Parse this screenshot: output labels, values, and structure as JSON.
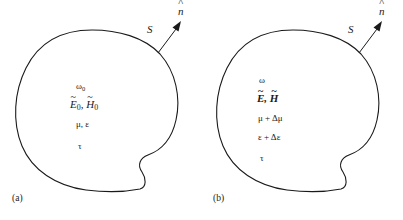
{
  "figure": {
    "type": "diagram",
    "background_color": "#ffffff",
    "line_color": "#1a1a1a"
  },
  "panels": [
    {
      "id": "a",
      "caption": "(a)",
      "surface_label": "S",
      "normal_label": "n",
      "normal_accent": "^",
      "interior": {
        "frequency": {
          "symbol": "ω",
          "subscript": "0"
        },
        "fields": {
          "electric": {
            "symbol": "E",
            "accent": "~",
            "subscript": "0"
          },
          "magnetic": {
            "symbol": "H",
            "accent": "~",
            "subscript": "0"
          },
          "separator": ",",
          "bold": false
        },
        "constitutive": [
          "μ, ε"
        ],
        "conductivity": "τ"
      }
    },
    {
      "id": "b",
      "caption": "(b)",
      "surface_label": "S",
      "normal_label": "n",
      "normal_accent": "^",
      "interior": {
        "frequency": {
          "symbol": "ω",
          "subscript": ""
        },
        "fields": {
          "electric": {
            "symbol": "E",
            "accent": "~",
            "subscript": ""
          },
          "magnetic": {
            "symbol": "H",
            "accent": "~",
            "subscript": ""
          },
          "separator": ",",
          "bold": true
        },
        "constitutive": [
          "μ + Δμ",
          "ε + Δε"
        ],
        "conductivity": "τ"
      }
    }
  ]
}
